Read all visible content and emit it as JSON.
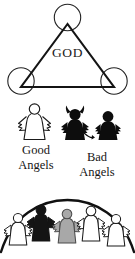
{
  "diagram": {
    "title_text": "GOD",
    "background_color": "#ffffff",
    "ink_color": "#1a1a1a",
    "trinity": {
      "name": "trinity-triangle",
      "center_label": "GOD",
      "vertex_count": 3,
      "vertices": [
        {
          "label": "",
          "cx": 67.5,
          "cy": 17.5,
          "r": 13.5
        },
        {
          "label": "",
          "cx": 21.0,
          "cy": 81.0,
          "r": 13.5
        },
        {
          "label": "",
          "cx": 114.0,
          "cy": 81.0,
          "r": 13.5
        }
      ]
    },
    "good_angels": {
      "caption_line1": "Good",
      "caption_line2": "Angels",
      "figure_fill": "#ffffff",
      "figure_stroke": "#1a1a1a",
      "figure_count": 1
    },
    "bad_angels": {
      "caption_line1": "Bad",
      "caption_line2": "Angels",
      "figure_fill": "#0d0d0d",
      "figure_stroke": "#0d0d0d",
      "figure_count": 2,
      "has_horns": true,
      "has_tail": true
    },
    "humans": {
      "figure_count": 5,
      "arc_stroke": "#111111",
      "figures": [
        {
          "fill": "#ffffff",
          "stroke": "#1a1a1a"
        },
        {
          "fill": "#141414",
          "stroke": "#141414"
        },
        {
          "fill": "#a8a8a8",
          "stroke": "#4a4a4a"
        },
        {
          "fill": "#ffffff",
          "stroke": "#1a1a1a"
        },
        {
          "fill": "#ffffff",
          "stroke": "#1a1a1a"
        }
      ]
    }
  }
}
